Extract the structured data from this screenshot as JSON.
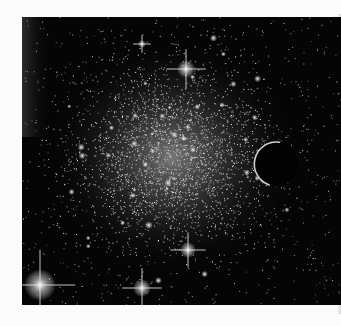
{
  "scene": {
    "subject": "globular star cluster with planet silhouette",
    "background_color": "#050505",
    "page_color": "#fbfbfb",
    "cluster_center": [
      150,
      140
    ],
    "planet": {
      "cx": 254,
      "cy": 147,
      "r": 22,
      "rim_color": "#cfcfcf"
    },
    "bright_stars": [
      {
        "x": 164,
        "y": 52,
        "r": 9
      },
      {
        "x": 18,
        "y": 268,
        "r": 16
      },
      {
        "x": 120,
        "y": 271,
        "r": 9
      },
      {
        "x": 166,
        "y": 233,
        "r": 8
      },
      {
        "x": 120,
        "y": 27,
        "r": 4
      }
    ]
  },
  "caption": {
    "text": ""
  }
}
